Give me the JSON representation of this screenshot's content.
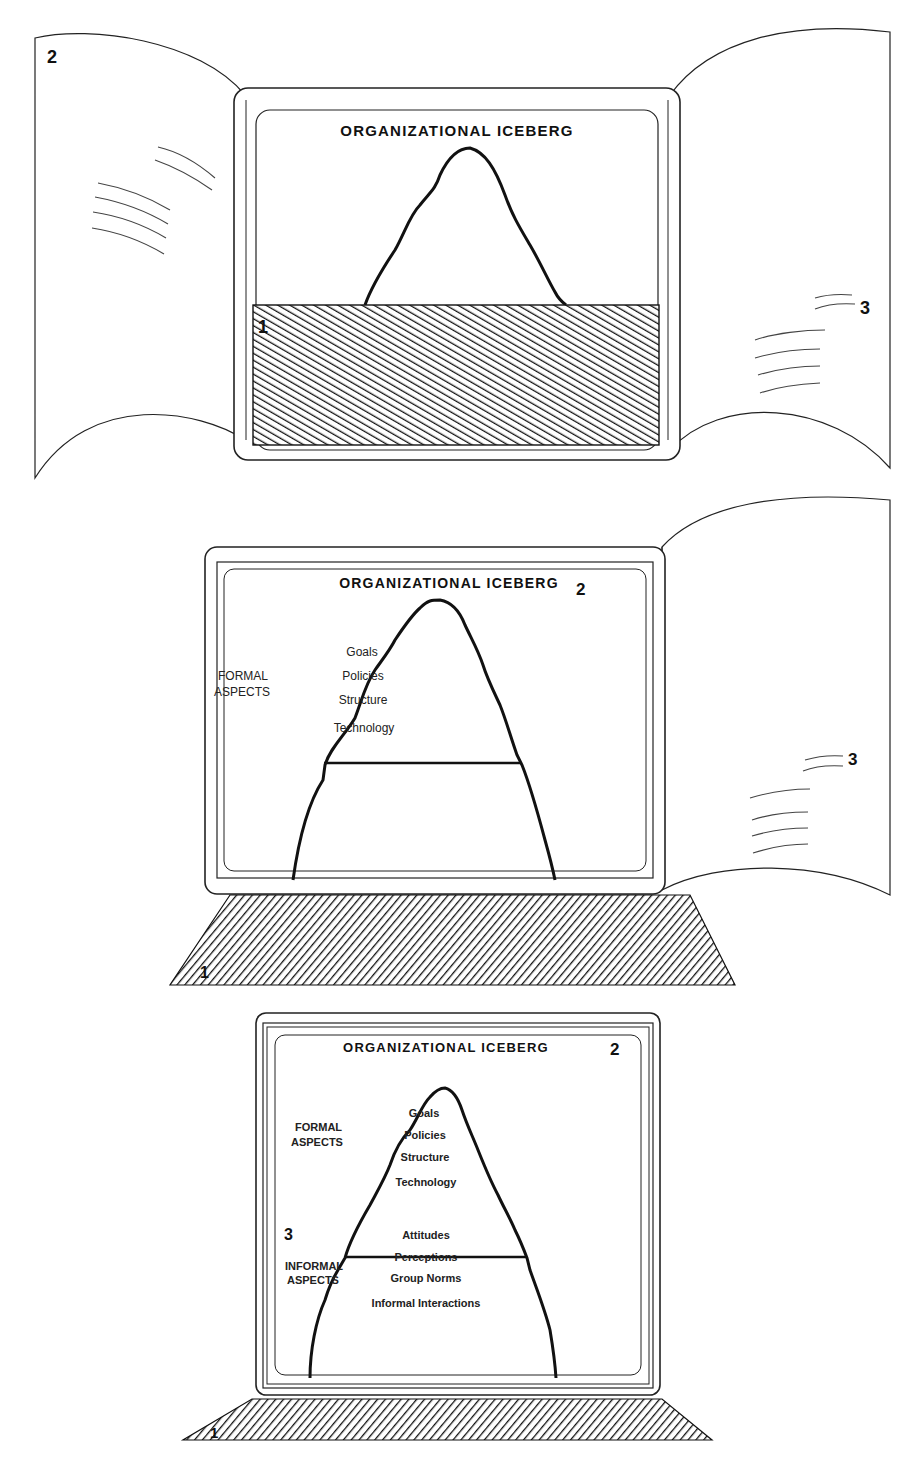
{
  "figure": {
    "title": "ORGANIZATIONAL ICEBERG",
    "panels": [
      {
        "id": "panel-1",
        "title": "ORGANIZATIONAL ICEBERG",
        "labels": {
          "flap_left": "2",
          "flap_right": "3",
          "cover": "1"
        }
      },
      {
        "id": "panel-2",
        "title": "ORGANIZATIONAL ICEBERG",
        "labels": {
          "screen": "2",
          "flap_right": "3",
          "base": "1"
        },
        "formal_label_line1": "FORMAL",
        "formal_label_line2": "ASPECTS",
        "formal_items": [
          "Goals",
          "Policies",
          "Structure",
          "Technology"
        ]
      },
      {
        "id": "panel-3",
        "title": "ORGANIZATIONAL ICEBERG",
        "labels": {
          "screen": "2",
          "informal": "3",
          "base": "1"
        },
        "formal_label_line1": "FORMAL",
        "formal_label_line2": "ASPECTS",
        "formal_items": [
          "Goals",
          "Policies",
          "Structure",
          "Technology"
        ],
        "informal_label_line1": "INFORMAL",
        "informal_label_line2": "ASPECTS",
        "informal_items": [
          "Attitudes",
          "Perceptions",
          "Group Norms",
          "Informal Interactions"
        ]
      }
    ]
  },
  "colors": {
    "ink": "#111111",
    "paper": "#ffffff",
    "faint_ink": "#555555"
  }
}
